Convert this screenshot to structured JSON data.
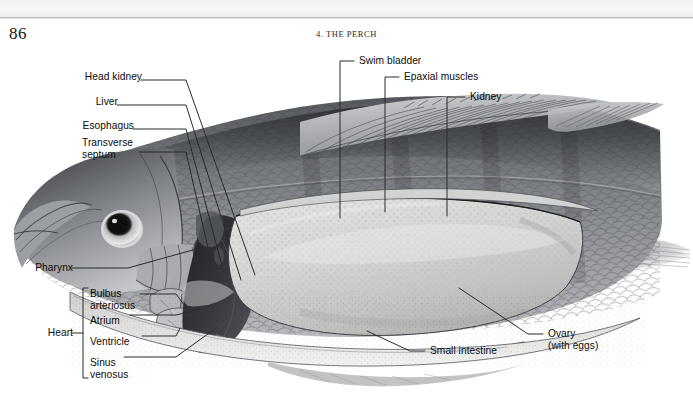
{
  "page": {
    "folio": "86",
    "running_head": "4. THE PERCH",
    "background_color": "#ffffff",
    "rule_color": "#b9b9bc"
  },
  "figure": {
    "name": "perch-internal-anatomy-illustration",
    "subject": "perch",
    "view": "lateral dissection, left side, anterior to the left",
    "palette": {
      "body_dark": "#3f4145",
      "body_mid": "#8a8d91",
      "body_light": "#c9cbce",
      "ovary_fill": "#cfd0cd",
      "liver_dark": "#2c2d30",
      "outline": "#1a1a1a",
      "leader": "#2b2b2b"
    },
    "labels": [
      {
        "id": "head-kidney",
        "text": "Head kidney",
        "side": "left"
      },
      {
        "id": "liver",
        "text": "Liver",
        "side": "left"
      },
      {
        "id": "esophagus",
        "text": "Esophagus",
        "side": "left"
      },
      {
        "id": "transverse-septum",
        "text": "Transverse\nseptum",
        "side": "left"
      },
      {
        "id": "pharynx",
        "text": "Pharynx",
        "side": "left"
      },
      {
        "id": "heart",
        "text": "Heart",
        "side": "left"
      },
      {
        "id": "bulbus-arteriosus",
        "text": "Bulbus\narteriosus",
        "side": "left"
      },
      {
        "id": "atrium",
        "text": "Atrium",
        "side": "left"
      },
      {
        "id": "ventricle",
        "text": "Ventricle",
        "side": "left"
      },
      {
        "id": "sinus-venosus",
        "text": "Sinus\nvenosus",
        "side": "left"
      },
      {
        "id": "swim-bladder",
        "text": "Swim bladder",
        "side": "top"
      },
      {
        "id": "epaxial-muscles",
        "text": "Epaxial muscles",
        "side": "top"
      },
      {
        "id": "kidney",
        "text": "Kidney",
        "side": "top"
      },
      {
        "id": "small-intestine",
        "text": "Small intestine",
        "side": "bottom"
      },
      {
        "id": "ovary",
        "text": "Ovary\n(with eggs)",
        "side": "right"
      }
    ],
    "heart_group": {
      "bracket_label": "Heart",
      "members": [
        "Bulbus arteriosus",
        "Atrium",
        "Ventricle",
        "Sinus venosus"
      ]
    }
  }
}
